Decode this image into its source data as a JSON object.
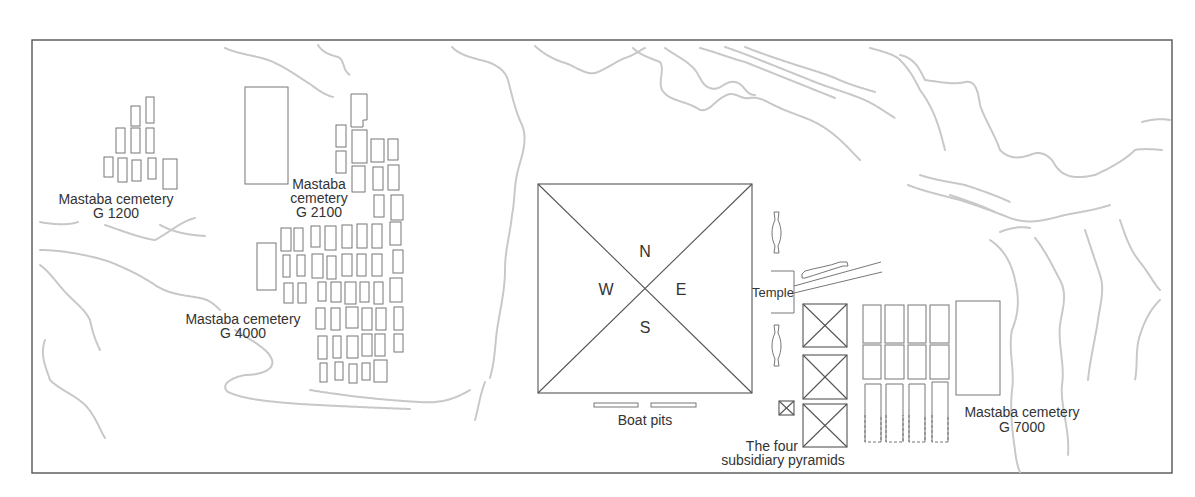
{
  "map": {
    "type": "site-plan",
    "labels": {
      "g1200": [
        "Mastaba cemetery",
        "G 1200"
      ],
      "g2100": [
        "Mastaba",
        "cemetery",
        "G 2100"
      ],
      "g4000": [
        "Mastaba cemetery",
        "G 4000"
      ],
      "g7000": [
        "Mastaba cemetery",
        "G 7000"
      ],
      "temple": "Temple",
      "boat_pits": "Boat pits",
      "subsidiary": [
        "The four",
        "subsidiary pyramids"
      ]
    },
    "directions": {
      "north": "N",
      "south": "S",
      "east": "E",
      "west": "W"
    },
    "colors": {
      "frame": "#555555",
      "outline": "#777777",
      "contour": "#c8c8c8",
      "text": "#333333"
    }
  }
}
